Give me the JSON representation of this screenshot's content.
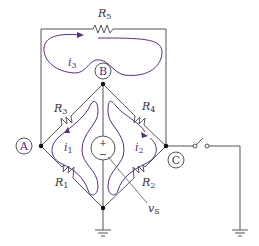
{
  "diagram": {
    "type": "circuit",
    "title": "",
    "colors": {
      "wire": "#555555",
      "loop": "#5b2a86",
      "text": "#333333"
    },
    "resistors": [
      {
        "id": "R5",
        "label": "R",
        "sub": "5"
      },
      {
        "id": "R3",
        "label": "R",
        "sub": "3"
      },
      {
        "id": "R4",
        "label": "R",
        "sub": "4"
      },
      {
        "id": "R1",
        "label": "R",
        "sub": "1"
      },
      {
        "id": "R2",
        "label": "R",
        "sub": "2"
      }
    ],
    "nodes": [
      {
        "id": "A",
        "label": "A"
      },
      {
        "id": "B",
        "label": "B"
      },
      {
        "id": "C",
        "label": "C"
      }
    ],
    "currents": [
      {
        "id": "i1",
        "label": "i",
        "sub": "1"
      },
      {
        "id": "i2",
        "label": "i",
        "sub": "2"
      },
      {
        "id": "i3",
        "label": "i",
        "sub": "3"
      }
    ],
    "source": {
      "label": "v",
      "sub": "S",
      "plus": "+",
      "minus": "−"
    },
    "switch": {
      "state": "open"
    },
    "grounds": 2
  }
}
